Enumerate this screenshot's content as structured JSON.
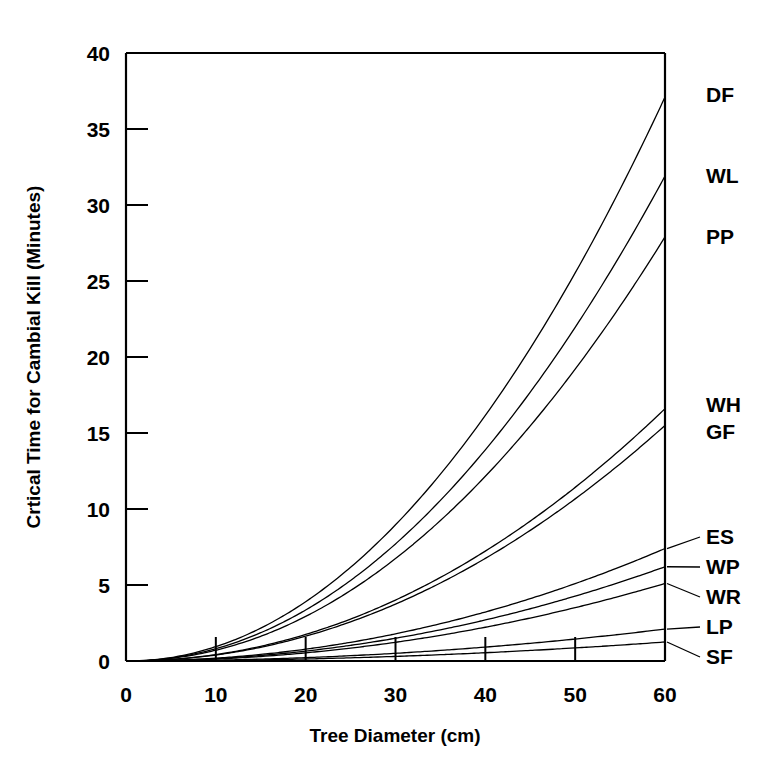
{
  "chart_data": {
    "type": "line",
    "title": "",
    "xlabel": "Tree Diameter (cm)",
    "ylabel": "Crtical Time for Cambial Kill (Minutes)",
    "xlim": [
      0,
      60
    ],
    "ylim": [
      0,
      40
    ],
    "xticks": [
      0,
      10,
      20,
      30,
      40,
      50,
      60
    ],
    "yticks": [
      0,
      5,
      10,
      15,
      20,
      25,
      30,
      35,
      40
    ],
    "grid": false,
    "legend_position": "right-inline-labels",
    "x": [
      0,
      10,
      20,
      30,
      40,
      50,
      60
    ],
    "series": [
      {
        "name": "DF",
        "label": "DF",
        "values": [
          0,
          1.4,
          4.5,
          9.6,
          16.9,
          26.0,
          37.1
        ]
      },
      {
        "name": "WL",
        "label": "WL",
        "values": [
          0,
          1.2,
          3.9,
          8.3,
          14.5,
          22.3,
          31.9
        ]
      },
      {
        "name": "PP",
        "label": "PP",
        "values": [
          0,
          1.05,
          3.4,
          7.2,
          12.7,
          19.5,
          27.9
        ]
      },
      {
        "name": "WH",
        "label": "WH",
        "values": [
          0,
          0.62,
          2.0,
          4.3,
          7.5,
          11.6,
          16.6
        ]
      },
      {
        "name": "GF",
        "label": "GF",
        "values": [
          0,
          0.58,
          1.9,
          4.0,
          7.0,
          10.8,
          15.5
        ]
      },
      {
        "name": "ES",
        "label": "ES",
        "values": [
          0,
          0.28,
          0.9,
          1.9,
          3.35,
          5.2,
          7.4
        ]
      },
      {
        "name": "WP",
        "label": "WP",
        "values": [
          0,
          0.23,
          0.75,
          1.6,
          2.8,
          4.3,
          6.2
        ]
      },
      {
        "name": "WR",
        "label": "WR",
        "values": [
          0,
          0.19,
          0.62,
          1.3,
          2.3,
          3.6,
          5.1
        ]
      },
      {
        "name": "LP",
        "label": "LP",
        "values": [
          0,
          0.08,
          0.26,
          0.55,
          0.95,
          1.47,
          2.1
        ]
      },
      {
        "name": "SF",
        "label": "SF",
        "values": [
          0,
          0.05,
          0.15,
          0.32,
          0.57,
          0.88,
          1.25
        ]
      }
    ],
    "series_labels_right": [
      {
        "text": "DF",
        "value": 37.1,
        "leader": false
      },
      {
        "text": "WL",
        "value": 31.9,
        "leader": false
      },
      {
        "text": "PP",
        "value": 27.9,
        "leader": false
      },
      {
        "text": "WH",
        "value": 16.6,
        "leader": false
      },
      {
        "text": "GF",
        "value": 15.5,
        "leader": false
      },
      {
        "text": "ES",
        "value": 7.4,
        "leader": true
      },
      {
        "text": "WP",
        "value": 6.2,
        "leader": true
      },
      {
        "text": "WR",
        "value": 5.1,
        "leader": true
      },
      {
        "text": "LP",
        "value": 2.1,
        "leader": true
      },
      {
        "text": "SF",
        "value": 1.25,
        "leader": true
      }
    ],
    "colors": {
      "axis": "#000000",
      "curve": "#000000",
      "background": "#ffffff"
    }
  },
  "axis": {
    "x_title": "Tree Diameter (cm)",
    "y_title": "Crtical Time for Cambial Kill (Minutes)",
    "x_tick_labels": [
      "0",
      "10",
      "20",
      "30",
      "40",
      "50",
      "60"
    ],
    "y_tick_labels": [
      "0",
      "5",
      "10",
      "15",
      "20",
      "25",
      "30",
      "35",
      "40"
    ]
  },
  "labels": {
    "DF": "DF",
    "WL": "WL",
    "PP": "PP",
    "WH": "WH",
    "GF": "GF",
    "ES": "ES",
    "WP": "WP",
    "WR": "WR",
    "LP": "LP",
    "SF": "SF"
  }
}
